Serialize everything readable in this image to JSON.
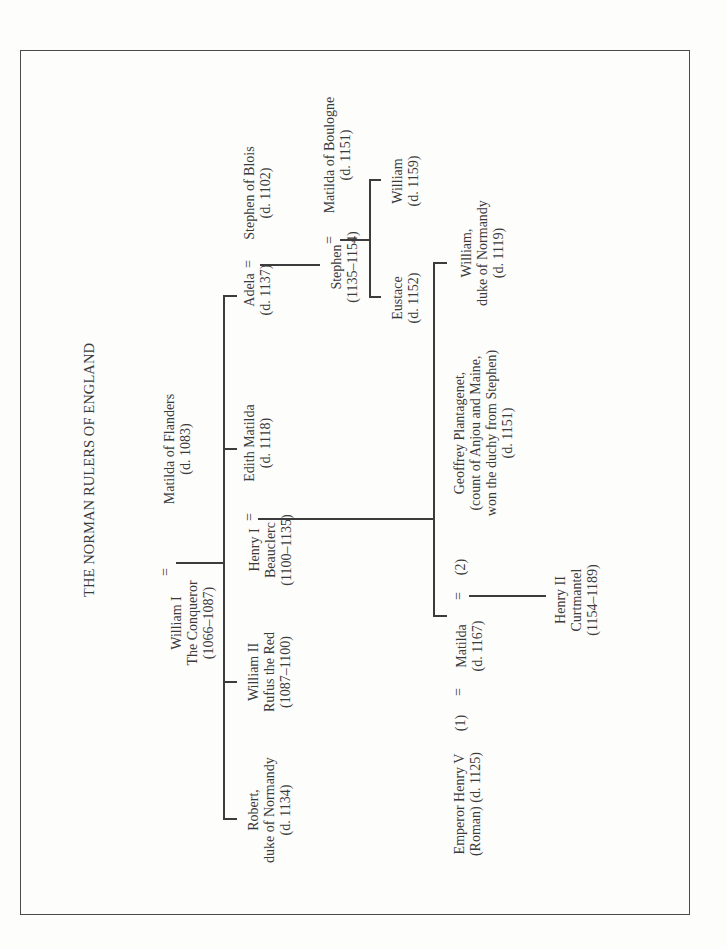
{
  "title": "THE NORMAN RULERS OF ENGLAND",
  "people": {
    "william_i": [
      "William I",
      "The Conqueror",
      "(1066–1087)"
    ],
    "matilda_flanders": [
      "Matilda of Flanders",
      "(d. 1083)"
    ],
    "robert": [
      "Robert,",
      "duke of Normandy",
      "(d. 1134)"
    ],
    "william_ii": [
      "William II",
      "Rufus the Red",
      "(1087–1100)"
    ],
    "henry_i": [
      "Henry I",
      "Beauclerc",
      "(1100–1135)"
    ],
    "edith_matilda": [
      "Edith Matilda",
      "(d. 1118)"
    ],
    "adela": [
      "Adela",
      "(d. 1137)"
    ],
    "stephen_blois": [
      "Stephen of Blois",
      "(d. 1102)"
    ],
    "stephen": [
      "Stephen",
      "(1135–1154)"
    ],
    "matilda_boulogne": [
      "Matilda of Boulogne",
      "(d. 1151)"
    ],
    "eustace": [
      "Eustace",
      "(d. 1152)"
    ],
    "william_boulogne": [
      "William",
      "(d. 1159)"
    ],
    "emperor_henry_v": [
      "Emperor Henry V",
      "(Roman) (d. 1125)"
    ],
    "matilda_empress": [
      "Matilda",
      "(d. 1167)"
    ],
    "geoffrey": [
      "Geoffrey Plantagenet,",
      "(count of Anjou and Maine,",
      "won the duchy from Stephen)",
      "(d. 1151)"
    ],
    "henry_ii": [
      "Henry II",
      "Curtmantel",
      "(1154–1189)"
    ],
    "william_normandy": [
      "William,",
      "duke of Normandy",
      "(d. 1119)"
    ]
  },
  "marks": {
    "marriage": "=",
    "first": "(1)",
    "second": "(2)"
  }
}
